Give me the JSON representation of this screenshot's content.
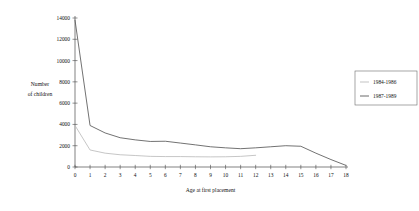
{
  "chart_data": {
    "type": "line",
    "title": "",
    "xlabel": "Age at first placement",
    "ylabel": "Number of children",
    "ylabel_line1": "Number",
    "ylabel_line2": "of children",
    "x": [
      0,
      1,
      2,
      3,
      4,
      5,
      6,
      7,
      8,
      9,
      10,
      11,
      12,
      13,
      14,
      15,
      16,
      17,
      18
    ],
    "xlim": [
      0,
      18
    ],
    "ylim": [
      0,
      14000
    ],
    "xticks": [
      "0",
      "1",
      "2",
      "3",
      "4",
      "5",
      "6",
      "7",
      "8",
      "9",
      "10",
      "11",
      "12",
      "13",
      "14",
      "15",
      "16",
      "17",
      "18"
    ],
    "yticks": [
      "0",
      "2000",
      "4000",
      "6000",
      "8000",
      "10000",
      "12000",
      "14000"
    ],
    "ytick_values": [
      0,
      2000,
      4000,
      6000,
      8000,
      10000,
      12000,
      14000
    ],
    "grid": false,
    "legend_position": "right",
    "series": [
      {
        "name": "1984-1986",
        "color": "#bcbcbc",
        "values": [
          3900,
          1600,
          1300,
          1150,
          1080,
          1000,
          980,
          980,
          960,
          950,
          960,
          1000,
          1100,
          null,
          null,
          null,
          null,
          null,
          null
        ]
      },
      {
        "name": "1987-1989",
        "color": "#595959",
        "values": [
          13800,
          3900,
          3200,
          2750,
          2550,
          2400,
          2420,
          2250,
          2080,
          1900,
          1800,
          1720,
          1800,
          1900,
          2000,
          1950,
          1300,
          700,
          150
        ]
      }
    ]
  },
  "legend": {
    "entries": [
      {
        "label": "1984-1986"
      },
      {
        "label": "1987-1989"
      }
    ]
  }
}
